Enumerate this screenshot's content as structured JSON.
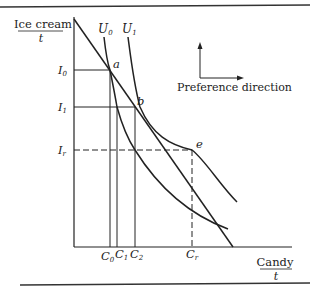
{
  "figure": {
    "y_axis_label": {
      "top": "Ice cream",
      "bottom": "t"
    },
    "x_axis_label": {
      "top": "Candy",
      "bottom": "t"
    },
    "indifference_curves": [
      {
        "label": "U",
        "sub": "0"
      },
      {
        "label": "U",
        "sub": "1"
      }
    ],
    "y_ticks": [
      {
        "label": "I",
        "sub": "0"
      },
      {
        "label": "I",
        "sub": "1"
      },
      {
        "label": "I",
        "sub": "r"
      }
    ],
    "x_ticks": [
      {
        "label": "C",
        "sub": "0"
      },
      {
        "label": "C",
        "sub": "1"
      },
      {
        "label": "C",
        "sub": "2"
      },
      {
        "label": "C",
        "sub": "r"
      }
    ],
    "points": [
      "a",
      "b",
      "e"
    ],
    "legend": {
      "text": "Preference direction"
    }
  }
}
